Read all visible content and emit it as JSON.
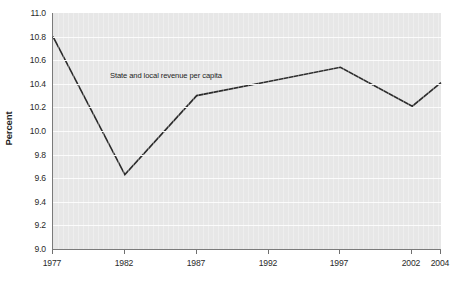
{
  "chart_data": {
    "type": "line",
    "title": "",
    "subtitle": "",
    "xlabel": "",
    "ylabel": "Percent",
    "x": [
      1977,
      1982,
      1987,
      1992,
      1997,
      2002,
      2004
    ],
    "xtick_labels": [
      "1977",
      "1982",
      "1987",
      "1992",
      "1997",
      "2002",
      "2004"
    ],
    "xlim": [
      1977,
      2004
    ],
    "ylim": [
      9.0,
      11.0
    ],
    "ytick_labels": [
      "11.0",
      "10.8",
      "10.6",
      "10.4",
      "10.2",
      "10.0",
      "9.8",
      "9.6",
      "9.4",
      "9.2",
      "9.0"
    ],
    "ytick_values": [
      11.0,
      10.8,
      10.6,
      10.4,
      10.2,
      10.0,
      9.8,
      9.6,
      9.4,
      9.2,
      9.0
    ],
    "grid": "horizontal",
    "legend_position": "inline-annotation",
    "series": [
      {
        "name": "State and local revenue per capita",
        "annotation": "State and local revenue per capita",
        "color": "#2b2b2b",
        "values": [
          10.8,
          9.63,
          10.3,
          10.42,
          10.54,
          10.21,
          10.41
        ]
      }
    ],
    "colors": {
      "plot_background": "#e7e7e7",
      "gridline": "#fbfbfb",
      "axis": "#7a7a7a",
      "series_line": "#2b2b2b",
      "text": "#2a2a2a",
      "page_background": "#ffffff"
    }
  }
}
